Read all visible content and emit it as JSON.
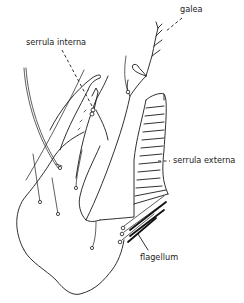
{
  "figure": {
    "labels": {
      "galea": "galea",
      "serrula_interna": "serrula interna",
      "serrula_externa": "serrula externa",
      "flagellum": "flagellum"
    },
    "colors": {
      "ink": "#1a1a1a",
      "background": "#ffffff"
    }
  }
}
